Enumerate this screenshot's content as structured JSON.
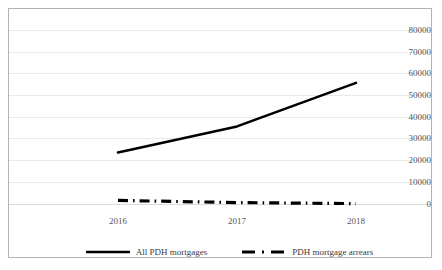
{
  "chart_data": {
    "type": "line",
    "title": "",
    "subtitle": "",
    "xlabel": "",
    "ylabel": "",
    "categories": [
      "2016",
      "2017",
      "2018"
    ],
    "x": [
      2016,
      2017,
      2018
    ],
    "series": [
      {
        "name": "All PDH mortgages",
        "style": "solid",
        "color": "#000000",
        "values": [
          37000,
          49000,
          69000
        ]
      },
      {
        "name": "PDH mortgage arrears",
        "style": "dash-dot",
        "color": "#000000",
        "values": [
          15000,
          14000,
          13500
        ]
      }
    ],
    "ylim": [
      0,
      80000
    ],
    "ytick_labels": [
      "0",
      "10000",
      "20000",
      "30000",
      "40000",
      "50000",
      "60000",
      "70000",
      "80000"
    ],
    "ytick_values": [
      0,
      10000,
      20000,
      30000,
      40000,
      50000,
      60000,
      70000,
      80000
    ],
    "xtick_labels": [
      "2016",
      "2017",
      "2018"
    ],
    "grid": true,
    "grid_axis": "y",
    "legend_position": "bottom",
    "border": true
  },
  "legend": {
    "entries": [
      {
        "label": "All PDH mortgages",
        "icon": "solid-line-swatch"
      },
      {
        "label": "PDH mortgage arrears",
        "icon": "dash-dot-line-swatch"
      }
    ]
  },
  "colors": {
    "series": "#000000",
    "gridline": "#e9e9e9",
    "axis_text": "#555555",
    "frame": "#b3b3b3",
    "background": "#ffffff"
  }
}
